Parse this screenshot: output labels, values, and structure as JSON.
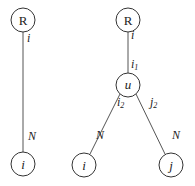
{
  "diagram": {
    "left_tree": {
      "root": {
        "label": "R",
        "cx": 23,
        "cy": 20
      },
      "leaf": {
        "label": "i",
        "cx": 23,
        "cy": 164
      },
      "edge_labels": {
        "top": "i",
        "bottom": "N"
      }
    },
    "right_tree": {
      "root": {
        "label": "R",
        "cx": 128,
        "cy": 20
      },
      "internal": {
        "label": "u",
        "cx": 128,
        "cy": 85
      },
      "leaf_left": {
        "label": "i",
        "cx": 84,
        "cy": 165
      },
      "leaf_right": {
        "label": "j",
        "cx": 171,
        "cy": 165
      },
      "edge_labels": {
        "root_top": "i",
        "u_top_base": "i",
        "u_top_sub": "1",
        "left_top_base": "i",
        "left_top_sub": "2",
        "right_top_base": "j",
        "right_top_sub": "2",
        "left_bottom": "N",
        "right_bottom": "N"
      }
    },
    "colors": {
      "stroke": "#333333",
      "edge": "#555555",
      "text": "#222222",
      "background": "#ffffff"
    }
  }
}
